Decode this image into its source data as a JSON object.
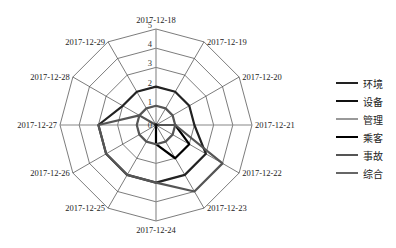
{
  "chart_data": {
    "type": "radar",
    "title": "",
    "categories": [
      "2017-12-18",
      "2017-12-19",
      "2017-12-20",
      "2017-12-21",
      "2017-12-22",
      "2017-12-23",
      "2017-12-24",
      "2017-12-25",
      "2017-12-26",
      "2017-12-27",
      "2017-12-28",
      "2017-12-29"
    ],
    "radial_ticks": [
      "0",
      "1",
      "2",
      "3",
      "4",
      "5"
    ],
    "rlim": [
      0,
      5
    ],
    "grid": true,
    "legend_position": "right",
    "series": [
      {
        "name": "环境",
        "color": "#222222",
        "width": 2.2,
        "values": [
          2,
          2,
          2,
          2,
          3,
          3,
          3,
          3,
          3,
          3,
          2,
          2
        ]
      },
      {
        "name": "设备",
        "color": "#111111",
        "width": 2.2,
        "values": [
          0,
          0,
          0,
          0,
          0,
          0,
          0,
          0,
          0,
          0,
          0,
          0
        ]
      },
      {
        "name": "管理",
        "color": "#999999",
        "width": 2.2,
        "values": [
          0,
          0,
          0,
          0,
          0,
          0,
          0,
          0,
          0,
          0,
          0,
          0
        ]
      },
      {
        "name": "乘客",
        "color": "#000000",
        "width": 2.2,
        "values": [
          0,
          0,
          0,
          1,
          2,
          2,
          1,
          0,
          0,
          0,
          0,
          0
        ]
      },
      {
        "name": "事故",
        "color": "#555555",
        "width": 2.2,
        "values": [
          0,
          0,
          0,
          1,
          4,
          4,
          3,
          3,
          3,
          3,
          1,
          0
        ]
      },
      {
        "name": "综合",
        "color": "#555555",
        "width": 2.2,
        "values": [
          1,
          1,
          1,
          1,
          1,
          1,
          1,
          1,
          1,
          1,
          1,
          1
        ]
      }
    ]
  },
  "legend": {
    "items": [
      {
        "label": "环境",
        "color": "#222222"
      },
      {
        "label": "设备",
        "color": "#111111"
      },
      {
        "label": "管理",
        "color": "#999999"
      },
      {
        "label": "乘客",
        "color": "#000000"
      },
      {
        "label": "事故",
        "color": "#555555"
      },
      {
        "label": "综合",
        "color": "#666666"
      }
    ]
  }
}
